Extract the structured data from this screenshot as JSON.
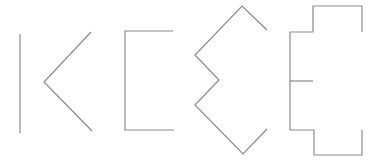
{
  "figure": {
    "width": 381,
    "height": 163,
    "background": "#ffffff",
    "stroke_color": "#8a8a8a",
    "stroke_width": 1.2,
    "shapes": [
      {
        "id": "shape-1-vertical-line",
        "label": "vertical line",
        "points": [
          [
            20,
            34
          ],
          [
            20,
            133
          ]
        ]
      },
      {
        "id": "shape-2-chevron",
        "label": "left-pointing chevron",
        "points": [
          [
            91,
            32
          ],
          [
            44,
            82
          ],
          [
            92,
            131
          ]
        ]
      },
      {
        "id": "shape-3-bracket",
        "label": "open rectangle bracket",
        "points": [
          [
            173,
            31
          ],
          [
            125,
            31
          ],
          [
            125,
            130
          ],
          [
            174,
            130
          ]
        ]
      },
      {
        "id": "shape-4-zigzag",
        "label": "double-chevron zigzag",
        "points": [
          [
            267,
            30
          ],
          [
            242,
            6
          ],
          [
            195,
            55
          ],
          [
            219,
            80
          ],
          [
            195,
            105
          ],
          [
            243,
            154
          ],
          [
            267,
            129
          ]
        ]
      },
      {
        "id": "shape-5-stepped-outline",
        "label": "stepped outline",
        "points": [
          [
            362,
            32
          ],
          [
            362,
            6
          ],
          [
            313,
            6
          ],
          [
            313,
            32
          ],
          [
            290,
            32
          ],
          [
            290,
            130
          ],
          [
            314,
            130
          ],
          [
            314,
            155
          ],
          [
            362,
            155
          ],
          [
            362,
            130
          ]
        ]
      },
      {
        "id": "shape-5-middle-bar",
        "label": "stepped outline middle bar",
        "points": [
          [
            290,
            81
          ],
          [
            313,
            81
          ]
        ]
      }
    ]
  }
}
